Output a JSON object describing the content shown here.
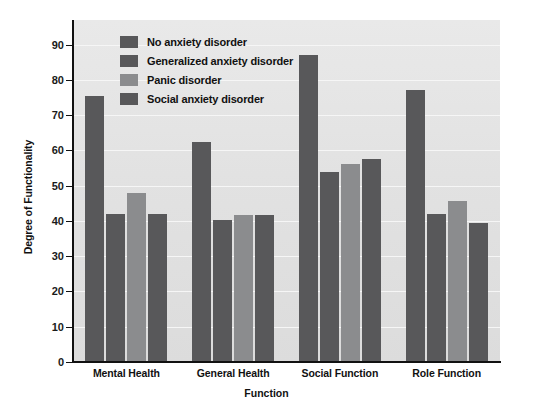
{
  "chart_data": {
    "type": "bar",
    "title": "",
    "subtitle": "",
    "xlabel": "Function",
    "ylabel": "Degree of Functionality",
    "categories": [
      "Mental Health",
      "General Health",
      "Social Function",
      "Role Function"
    ],
    "series": [
      {
        "name": "No anxiety disorder",
        "color": "#58585a",
        "values": [
          75.5,
          62.3,
          87.0,
          77.2
        ]
      },
      {
        "name": "Generalized anxiety disorder",
        "color": "#58585a",
        "values": [
          42.0,
          40.2,
          54.0,
          42.0
        ]
      },
      {
        "name": "Panic disorder",
        "color": "#8b8c8e",
        "values": [
          48.0,
          41.6,
          56.2,
          45.6
        ]
      },
      {
        "name": "Social anxiety disorder",
        "color": "#58585a",
        "values": [
          42.0,
          41.7,
          57.7,
          39.3
        ]
      }
    ],
    "ylim": [
      0,
      97
    ],
    "yticks": [
      0,
      10,
      20,
      30,
      40,
      50,
      60,
      70,
      80,
      90
    ],
    "ytick_labels": [
      "0",
      "10",
      "20",
      "30",
      "40",
      "50",
      "60",
      "70",
      "80",
      "90"
    ],
    "grid": "horizontal",
    "gridline_color": "#f6f6f6",
    "plot_background": "#e4e4e4",
    "legend_position": "upper-left-inside",
    "annotations": []
  }
}
